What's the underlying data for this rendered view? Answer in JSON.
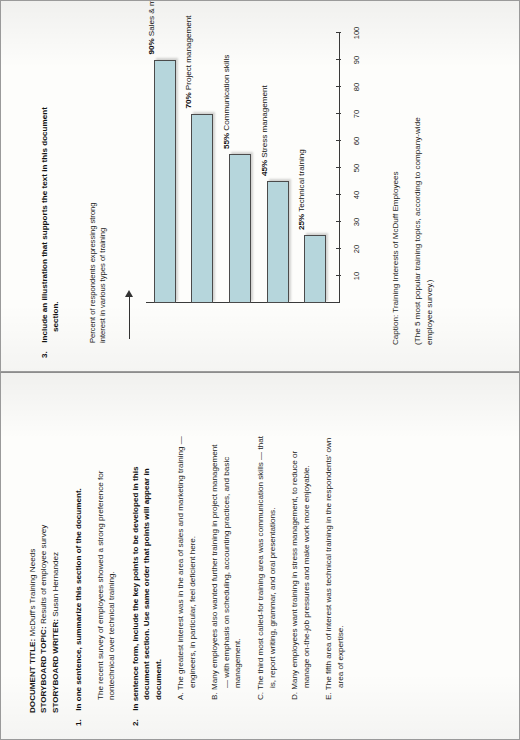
{
  "left_page": {
    "header": [
      {
        "label": "DOCUMENT TITLE:",
        "value": " McDuff's Training Needs"
      },
      {
        "label": "STORYBOARD TOPIC:",
        "value": " Results of employee survey"
      },
      {
        "label": "STORYBOARD WRITER:",
        "value": " Susan Hernandez"
      }
    ],
    "sections": [
      {
        "number": "1.",
        "heading": "In one sentence, summarize this section of the document.",
        "body": "The recent survey of employees showed a strong preference for nontechnical over technical training."
      },
      {
        "number": "2.",
        "heading": "In sentence form, include the key points to be developed in this document section. Use same order that points will appear in document.",
        "items": [
          {
            "letter": "A.",
            "text": "The greatest interest was in the area of sales and marketing training — engineers, in particular, feel deficient here."
          },
          {
            "letter": "B.",
            "text": "Many employees also wanted further training in project management — with emphasis on scheduling, accounting practices, and basic management."
          },
          {
            "letter": "C.",
            "text": "The third most called-for training area was communication skills — that is, report writing, grammar, and oral presentations."
          },
          {
            "letter": "D.",
            "text": "Many employees want training in stress management, to reduce or manage on-the-job pressures and make work more enjoyable."
          },
          {
            "letter": "E.",
            "text": "The fifth area of interest was technical training in the respondents' own area of expertise."
          }
        ]
      }
    ]
  },
  "right_page": {
    "section": {
      "number": "3.",
      "heading": "Include an illustration that supports the text in this document section."
    },
    "caption": "Caption: Training Interests of McDuff Employees",
    "caption_note": "(The 5 most popular training topics, according to company-wide employee survey.)"
  },
  "chart_data": {
    "type": "bar",
    "orientation": "horizontal",
    "title": "",
    "ylabel": "Percent of respondents expressing strong interest in various types of training",
    "xlabel": "",
    "categories": [
      "Sales & marketing training",
      "Project management",
      "Communication skills",
      "Stress management",
      "Technical training"
    ],
    "values": [
      90,
      70,
      55,
      45,
      25
    ],
    "value_labels": [
      "90%",
      "70%",
      "55%",
      "45%",
      "25%"
    ],
    "bar_labels": [
      "90% Sales & marketing training",
      "70% Project management",
      "55% Communication skills",
      "45% Stress management",
      "25% Technical training"
    ],
    "axis_ticks": [
      10,
      20,
      30,
      40,
      50,
      60,
      70,
      80,
      90,
      100
    ],
    "axis_tick_labels": [
      "10",
      "20",
      "30",
      "40",
      "50",
      "60",
      "70",
      "80",
      "90",
      "100"
    ],
    "xlim": [
      0,
      100
    ],
    "grid": false,
    "legend": false,
    "bar_color": "#b6d6dc",
    "bar_edge_color": "#4b4b4b"
  }
}
